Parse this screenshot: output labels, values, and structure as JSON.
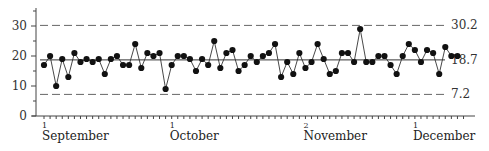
{
  "chart_data": {
    "type": "line",
    "title": "",
    "xlabel": "",
    "ylabel": "",
    "ylim": [
      0,
      35
    ],
    "yticks": [
      0,
      10,
      20,
      30
    ],
    "grid": false,
    "legend": null,
    "x_month_labels": [
      {
        "day": "1",
        "month": "September",
        "index": 0
      },
      {
        "day": "1",
        "month": "October",
        "index": 21
      },
      {
        "day": "2",
        "month": "November",
        "index": 43
      },
      {
        "day": "1",
        "month": "December",
        "index": 61
      }
    ],
    "reference_lines": [
      {
        "name": "upper_control_limit",
        "value": 30.2,
        "label": "30.2",
        "style": "dashed"
      },
      {
        "name": "center_line",
        "value": 18.7,
        "label": "18.7",
        "style": "solid"
      },
      {
        "name": "lower_control_limit",
        "value": 7.2,
        "label": "7.2",
        "style": "dashed"
      }
    ],
    "series": [
      {
        "name": "daily values",
        "marker": "filled-circle",
        "values": [
          17,
          20,
          10,
          19,
          13,
          21,
          18,
          19,
          18,
          19,
          14,
          19,
          20,
          17,
          17,
          24,
          16,
          21,
          20,
          21,
          9,
          17,
          20,
          20,
          19,
          15,
          19,
          17,
          25,
          16,
          21,
          22,
          15,
          17,
          20,
          18,
          20,
          21,
          24,
          13,
          18,
          14,
          21,
          16,
          18,
          24,
          19,
          14,
          15,
          21,
          21,
          18,
          29,
          18,
          18,
          20,
          20,
          17,
          14,
          20,
          24,
          22,
          18,
          22,
          21,
          14,
          23,
          20,
          20
        ]
      }
    ]
  },
  "colors": {
    "line": "#333333",
    "marker": "#111111",
    "axis": "#444444",
    "dashed": "#666666"
  }
}
